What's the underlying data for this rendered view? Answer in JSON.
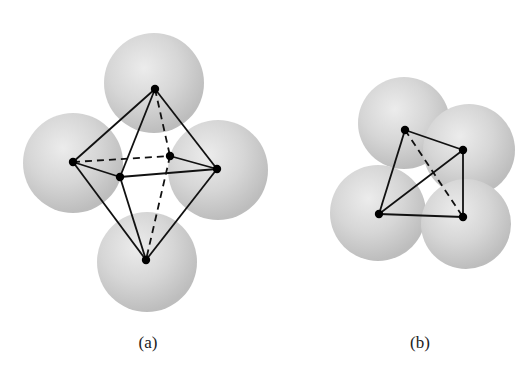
{
  "figure": {
    "panels": [
      {
        "id": "a",
        "label": "(a)",
        "shape": "octahedron",
        "spheres": [
          {
            "cx": 154,
            "cy": 83,
            "r": 50
          },
          {
            "cx": 73,
            "cy": 163,
            "r": 50
          },
          {
            "cx": 218,
            "cy": 170,
            "r": 50
          },
          {
            "cx": 147,
            "cy": 262,
            "r": 50
          }
        ],
        "vertices": {
          "top": [
            155,
            89
          ],
          "left": [
            73,
            162
          ],
          "back": [
            170,
            156
          ],
          "front": [
            120,
            177
          ],
          "right": [
            217,
            169
          ],
          "bottom": [
            146,
            260
          ]
        },
        "solid_edges": [
          [
            "top",
            "left"
          ],
          [
            "top",
            "front"
          ],
          [
            "top",
            "right"
          ],
          [
            "left",
            "front"
          ],
          [
            "front",
            "right"
          ],
          [
            "back",
            "right"
          ],
          [
            "left",
            "bottom"
          ],
          [
            "front",
            "bottom"
          ],
          [
            "right",
            "bottom"
          ]
        ],
        "dashed_edges": [
          [
            "top",
            "back"
          ],
          [
            "left",
            "back"
          ],
          [
            "back",
            "bottom"
          ]
        ]
      },
      {
        "id": "b",
        "label": "(b)",
        "shape": "tetrahedron",
        "spheres": [
          {
            "cx": 404,
            "cy": 123,
            "r": 46
          },
          {
            "cx": 469,
            "cy": 150,
            "r": 46
          },
          {
            "cx": 378,
            "cy": 213,
            "r": 48
          },
          {
            "cx": 466,
            "cy": 224,
            "r": 45
          }
        ],
        "vertices": {
          "tl": [
            405,
            130
          ],
          "r": [
            463,
            150
          ],
          "bl": [
            379,
            214
          ],
          "br": [
            463,
            217
          ]
        },
        "solid_edges": [
          [
            "tl",
            "r"
          ],
          [
            "tl",
            "bl"
          ],
          [
            "bl",
            "r"
          ],
          [
            "bl",
            "br"
          ],
          [
            "r",
            "br"
          ]
        ],
        "dashed_edges": [
          [
            "tl",
            "br"
          ]
        ]
      }
    ],
    "colors": {
      "sphere_light": "#e6e6e6",
      "sphere_mid": "#cfcfcf",
      "sphere_dark": "#b8b8b8",
      "edge": "#111111",
      "vertex": "#000000"
    }
  },
  "labels": {
    "a": {
      "text": "(a)",
      "x": 148,
      "y": 333
    },
    "b": {
      "text": "(b)",
      "x": 420,
      "y": 333
    }
  }
}
